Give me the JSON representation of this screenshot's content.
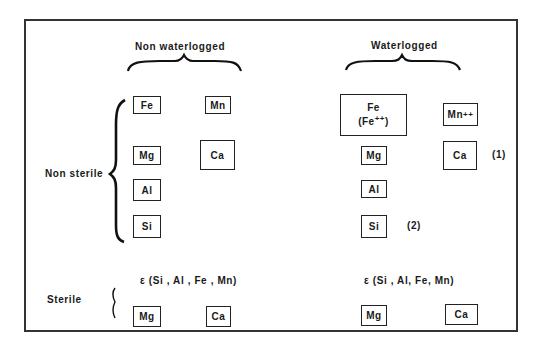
{
  "diagram": {
    "columns": {
      "non_waterlogged": {
        "label": "Non waterlogged"
      },
      "waterlogged": {
        "label": "Waterlogged"
      }
    },
    "rows": {
      "non_sterile": {
        "label": "Non sterile"
      },
      "sterile": {
        "label": "Sterile"
      }
    },
    "non_sterile": {
      "non_waterlogged": {
        "fe": "Fe",
        "mn": "Mn",
        "mg": "Mg",
        "ca": "Ca",
        "al": "Al",
        "si": "Si"
      },
      "waterlogged": {
        "fe": "Fe",
        "fe_ion": "(Fe",
        "fe_ion_charge": "++",
        "fe_ion_close": ")",
        "mn": "Mn",
        "mn_charge": "++",
        "mg": "Mg",
        "ca": "Ca",
        "ca_note": "(1)",
        "al": "Al",
        "si": "Si",
        "si_note": "(2)"
      }
    },
    "sterile": {
      "non_waterlogged": {
        "trace": "ε (Si , Al , Fe , Mn)",
        "mg": "Mg",
        "ca": "Ca"
      },
      "waterlogged": {
        "trace": "ε (Si , Al, Fe, Mn)",
        "mg": "Mg",
        "ca": "Ca"
      }
    }
  }
}
